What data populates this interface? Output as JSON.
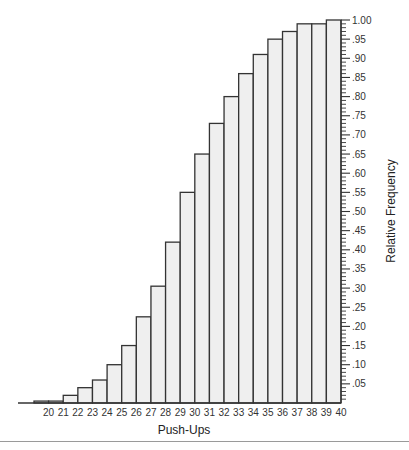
{
  "chart_data": {
    "type": "bar",
    "subtype": "cumulative-relative-frequency-histogram",
    "title": "",
    "xlabel": "Push-Ups",
    "ylabel": "Relative Frequency",
    "bin_edges": [
      19,
      20,
      21,
      22,
      23,
      24,
      25,
      26,
      27,
      28,
      29,
      30,
      31,
      32,
      33,
      34,
      35,
      36,
      37,
      38,
      39,
      40
    ],
    "x_tick_labels": [
      "20",
      "21",
      "22",
      "23",
      "24",
      "25",
      "26",
      "27",
      "28",
      "29",
      "30",
      "31",
      "32",
      "33",
      "34",
      "35",
      "36",
      "37",
      "38",
      "39",
      "40"
    ],
    "values": [
      0.005,
      0.005,
      0.02,
      0.04,
      0.06,
      0.1,
      0.15,
      0.225,
      0.305,
      0.42,
      0.55,
      0.65,
      0.73,
      0.8,
      0.86,
      0.91,
      0.95,
      0.97,
      0.99,
      0.99,
      1.0
    ],
    "ylim": [
      0,
      1.0
    ],
    "y_axis_side": "right",
    "y_major_step": 0.05,
    "y_minor_step": 0.01,
    "y_tick_labels": [
      ".05",
      ".10",
      ".15",
      ".20",
      ".25",
      ".30",
      ".35",
      ".40",
      ".45",
      ".50",
      ".55",
      ".60",
      ".65",
      ".70",
      ".75",
      ".80",
      ".85",
      ".90",
      ".95",
      "1.00"
    ],
    "grid": false,
    "legend": "none"
  }
}
